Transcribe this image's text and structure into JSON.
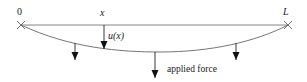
{
  "diagram": {
    "type": "deflected-beam",
    "labels": {
      "left_end": "0",
      "right_end": "L",
      "position": "x",
      "displacement": "u(x)",
      "force": "applied force"
    },
    "colors": {
      "line": "#555555",
      "arrow": "#111111",
      "text": "#222222"
    }
  }
}
